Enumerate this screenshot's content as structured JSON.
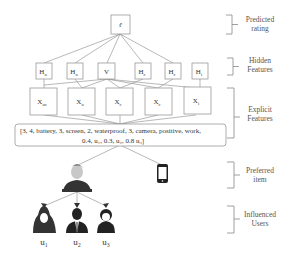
{
  "diagram": {
    "layers": {
      "predicted_rating": "Predicted rating",
      "predicted_rating_line1": "Predicted",
      "predicted_rating_line2": "rating",
      "hidden_features_line1": "Hidden",
      "hidden_features_line2": "Features",
      "explicit_features_line1": "Explicit",
      "explicit_features_line2": "Features",
      "preferred_item_line1": "Preferred",
      "preferred_item_line2": "item",
      "influenced_users_line1": "Influenced",
      "influenced_users_line2": "Users"
    },
    "output_node": {
      "label": "r̂"
    },
    "hidden_nodes": [
      {
        "base": "H",
        "sub": "u"
      },
      {
        "base": "H",
        "sub": "u"
      },
      {
        "base": "V",
        "sub": ""
      },
      {
        "base": "H",
        "sub": "c"
      },
      {
        "base": "H",
        "sub": "c"
      },
      {
        "base": "H",
        "sub": "i"
      }
    ],
    "explicit_nodes": [
      {
        "base": "X",
        "sub": "uc"
      },
      {
        "base": "X",
        "sub": "u"
      },
      {
        "base": "X",
        "sub": "c"
      },
      {
        "base": "X",
        "sub": "c"
      },
      {
        "base": "X",
        "sub": "i"
      }
    ],
    "feature_vector": {
      "line1": "[3, 4, battery, 3, screen, 2, waterproof, 3, camera, positive, work,",
      "line2": "0.4, u₁, 0.3, u₂, 0.8 u₃]"
    },
    "preferred_item_icon": "smartphone-icon",
    "main_user_icon": "user-avatar-icon",
    "influenced_users": [
      {
        "label": "u₁",
        "icon": "female-user-icon"
      },
      {
        "label": "u₂",
        "icon": "business-user-icon"
      },
      {
        "label": "u₃",
        "icon": "female-user-icon"
      }
    ]
  }
}
